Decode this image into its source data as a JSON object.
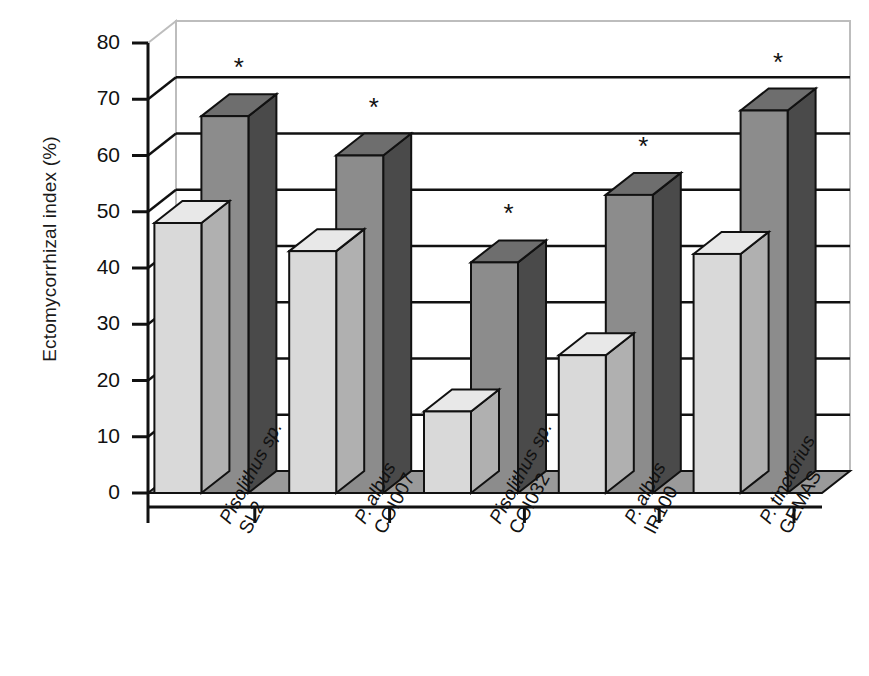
{
  "chart_data": {
    "type": "bar",
    "title": "",
    "xlabel": "",
    "ylabel": "Ectomycorrhizal index (%)",
    "ylim": [
      0,
      80
    ],
    "ytick_labels": [
      "0",
      "10",
      "20",
      "30",
      "40",
      "50",
      "60",
      "70",
      "80"
    ],
    "ytick_values": [
      0,
      10,
      20,
      30,
      40,
      50,
      60,
      70,
      80
    ],
    "grid": true,
    "legend": "none",
    "style": "3d-column",
    "categories": [
      {
        "genus": "Pisolithus sp.",
        "strain": "SL2"
      },
      {
        "genus": "P. albus",
        "strain": "COI007"
      },
      {
        "genus": "Pisolithus sp.",
        "strain": "COI032"
      },
      {
        "genus": "P. albus",
        "strain": "IR100"
      },
      {
        "genus": "P. tinctorius",
        "strain": "GEMAS"
      }
    ],
    "series": [
      {
        "name": "light",
        "color": "#d9d9d9",
        "values": [
          48,
          43,
          14.5,
          24.5,
          42.5
        ]
      },
      {
        "name": "dark",
        "color": "#8c8c8c",
        "values": [
          67,
          60,
          41,
          53,
          68
        ]
      }
    ],
    "annotations": [
      {
        "symbol": "*",
        "series": "dark",
        "category_index": 0
      },
      {
        "symbol": "*",
        "series": "dark",
        "category_index": 1
      },
      {
        "symbol": "*",
        "series": "dark",
        "category_index": 2
      },
      {
        "symbol": "*",
        "series": "dark",
        "category_index": 3
      },
      {
        "symbol": "*",
        "series": "dark",
        "category_index": 4
      }
    ],
    "colors": {
      "light_front": "#d9d9d9",
      "light_top": "#e8e8e8",
      "light_side": "#b0b0b0",
      "dark_front": "#8c8c8c",
      "dark_top": "#6e6e6e",
      "dark_side": "#4a4a4a",
      "floor": "#9a9a9a",
      "outline": "#111111",
      "gridline": "#111111",
      "back_wall": "#ffffff"
    }
  }
}
